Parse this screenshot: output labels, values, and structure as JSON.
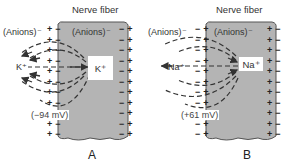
{
  "panels": [
    {
      "id": "A",
      "title": "Nerve fiber",
      "outside_anions": "(Anions)⁻",
      "inside_anions": "(Anions)⁻",
      "outside_ion": "K⁺",
      "inside_ion": "K⁺",
      "potential": "(−94 mV)",
      "letter": "A",
      "membrane_outer_charge": "+",
      "membrane_inner_charge": "−",
      "right_outer_charge": "+",
      "right_inner_charge": "−"
    },
    {
      "id": "B",
      "title": "Nerve fiber",
      "outside_anions": "(Anions)⁻",
      "inside_anions": "(Anions)⁻",
      "outside_ion": "Na⁺",
      "inside_ion": "Na⁺",
      "potential": "(+61 mV)",
      "letter": "B",
      "membrane_outer_charge": "−",
      "membrane_inner_charge": "+",
      "right_outer_charge": "−",
      "right_inner_charge": "+"
    }
  ],
  "colors": {
    "fiber_fill": "#b4b4b4",
    "fiber_border": "#555555",
    "arrow": "#333333",
    "background": "#ffffff"
  }
}
